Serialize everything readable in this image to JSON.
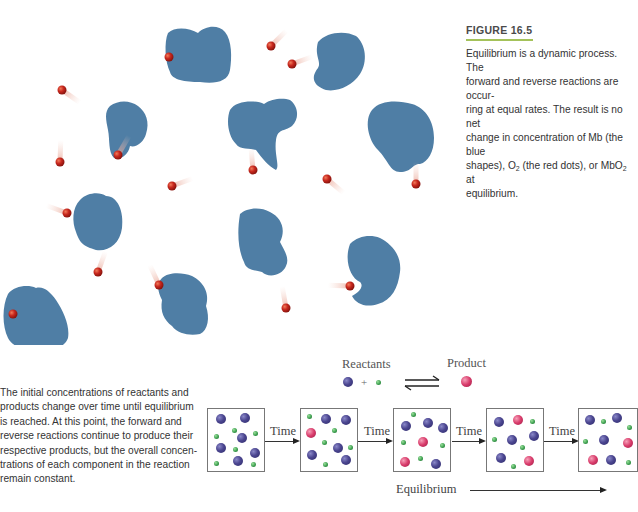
{
  "figure": {
    "label": "FIGURE 16.5",
    "accent_color": "#a4c25a",
    "caption_line1": "Equilibrium is a dynamic process. The",
    "caption_line2": "forward and reverse reactions are occur-",
    "caption_line3": "ring at equal rates. The result is no net",
    "caption_line4": "change in concentration of Mb (the blue",
    "caption_line5a": "shapes), O",
    "caption_line5_sub1": "2",
    "caption_line5b": " (the red dots), or MbO",
    "caption_line5_sub2": "2",
    "caption_line5c": " at",
    "caption_line6": "equilibrium."
  },
  "illustration": {
    "description": "Mb molecules (blue shapes) and O2 molecules (red dots) moving and binding",
    "shape_color": "#4f7ea5",
    "dot_color": "#c8281e"
  },
  "side_text": {
    "lines": [
      "The initial concentrations of reactants and",
      "products change over time until equilibrium",
      "is reached. At this point, the forward and",
      "reverse reactions continue to produce their",
      "respective products, but the overall concen-",
      "trations of each component in the reaction",
      "remain constant."
    ]
  },
  "legend": {
    "reactants_label": "Reactants",
    "plus": "+",
    "product_label": "Product"
  },
  "timeline": {
    "step_label": "Time",
    "equilibrium_label": "Equilibrium",
    "boxes": [
      {
        "name": "box-1-initial"
      },
      {
        "name": "box-2"
      },
      {
        "name": "box-3-equilibrium"
      },
      {
        "name": "box-4-equilibrium"
      },
      {
        "name": "box-5-equilibrium"
      }
    ]
  }
}
